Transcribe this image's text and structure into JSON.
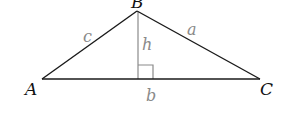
{
  "diagram": {
    "vertices": {
      "A": {
        "label": "A",
        "x": 42,
        "y": 79
      },
      "B": {
        "label": "B",
        "x": 137,
        "y": 11
      },
      "C": {
        "label": "C",
        "x": 260,
        "y": 79
      }
    },
    "sides": {
      "a": {
        "label": "a",
        "from": "B",
        "to": "C"
      },
      "b": {
        "label": "b",
        "from": "A",
        "to": "C"
      },
      "c": {
        "label": "c",
        "from": "A",
        "to": "B"
      }
    },
    "altitude": {
      "label": "h",
      "from": "B",
      "foot": {
        "x": 138,
        "y": 79
      },
      "right_angle_marker": true
    },
    "colors": {
      "triangle_stroke": "#1a1a1a",
      "altitude_stroke": "#8a8a8a",
      "vertex_label": "#111111",
      "side_label": "#8a8a8a",
      "background": "#ffffff"
    }
  }
}
